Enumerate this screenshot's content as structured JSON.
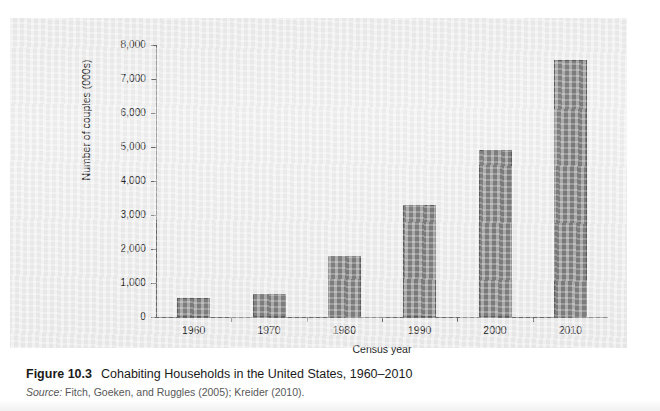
{
  "figure": {
    "label": "Figure 10.3",
    "title": "Cohabiting Households in the United States, 1960–2010",
    "source_label": "Source:",
    "source_text": "Fitch, Goeken, and Ruggles (2005); Kreider (2010)."
  },
  "colors": {
    "bar_fill": "#7f7f7f",
    "bar_stroke": "#5e5e5e",
    "axis": "#6b6b6b",
    "panel_background": "#eeeeee",
    "page_background": "#ffffff",
    "text": "#242424"
  },
  "chart_data": {
    "type": "bar",
    "title": "Cohabiting Households in the United States, 1960–2010",
    "xlabel": "Census year",
    "ylabel": "Number of couples (000s)",
    "categories": [
      "1960",
      "1970",
      "1980",
      "1990",
      "2000",
      "2010"
    ],
    "values": [
      560,
      680,
      1800,
      3300,
      4900,
      7550
    ],
    "ylim": [
      0,
      8000
    ],
    "ytick_values": [
      0,
      1000,
      2000,
      3000,
      4000,
      5000,
      6000,
      7000,
      8000
    ],
    "ytick_labels": [
      "0",
      "1,000",
      "2,000",
      "3,000",
      "4,000",
      "5,000",
      "6,000",
      "7,000",
      "8,000"
    ],
    "grid": false,
    "legend": false,
    "series": [
      {
        "name": "Cohabiting couples",
        "values": [
          560,
          680,
          1800,
          3300,
          4900,
          7550
        ]
      }
    ]
  }
}
